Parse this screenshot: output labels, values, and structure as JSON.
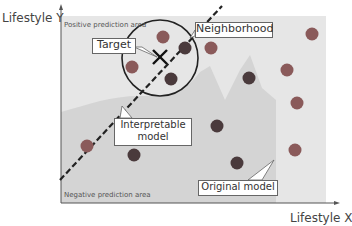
{
  "axes": {
    "y_label": "Lifestyle Y",
    "x_label": "Lifestyle X"
  },
  "areas": {
    "positive": "Positive prediction area",
    "negative": "Negative prediction area"
  },
  "callouts": {
    "target": "Target",
    "neighborhood": "Neighborhood",
    "interpretable_line1": "Interpretable",
    "interpretable_line2": "model",
    "original": "Original model"
  },
  "colors": {
    "positive_bg": "#e6e6e6",
    "negative_bg": "#d4d4d4",
    "dot_red": "#8a5a5a",
    "dot_dark": "#4a3a3c"
  },
  "points": [
    {
      "x": 163,
      "y": 37,
      "type": "red"
    },
    {
      "x": 185,
      "y": 48,
      "type": "dark"
    },
    {
      "x": 132,
      "y": 67,
      "type": "red"
    },
    {
      "x": 171,
      "y": 79,
      "type": "dark"
    },
    {
      "x": 211,
      "y": 48,
      "type": "red"
    },
    {
      "x": 312,
      "y": 34,
      "type": "red"
    },
    {
      "x": 249,
      "y": 78,
      "type": "dark"
    },
    {
      "x": 287,
      "y": 70,
      "type": "red"
    },
    {
      "x": 297,
      "y": 103,
      "type": "red"
    },
    {
      "x": 217,
      "y": 126,
      "type": "dark"
    },
    {
      "x": 87,
      "y": 146,
      "type": "red"
    },
    {
      "x": 134,
      "y": 155,
      "type": "dark"
    },
    {
      "x": 237,
      "y": 163,
      "type": "dark"
    },
    {
      "x": 295,
      "y": 150,
      "type": "red"
    }
  ]
}
